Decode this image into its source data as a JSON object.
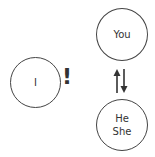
{
  "diagram": {
    "nodes": [
      {
        "id": "i",
        "lines": [
          "I"
        ]
      },
      {
        "id": "you",
        "lines": [
          "You"
        ]
      },
      {
        "id": "he_she",
        "lines": [
          "He",
          "She"
        ]
      }
    ],
    "exclamation": "!",
    "arrow_symbol": "up-down-arrows"
  }
}
